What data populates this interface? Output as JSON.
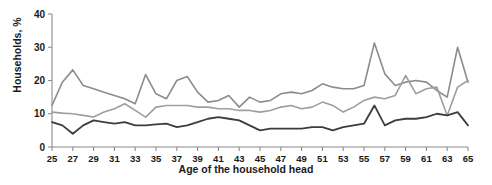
{
  "chart_data": {
    "type": "line",
    "title": "",
    "xlabel": "Age of the household head",
    "ylabel": "Households, %",
    "xlim": [
      25,
      65
    ],
    "ylim": [
      0,
      40
    ],
    "yticks": [
      0,
      10,
      20,
      30,
      40
    ],
    "xticks": [
      25,
      27,
      29,
      31,
      33,
      35,
      37,
      39,
      41,
      43,
      45,
      47,
      49,
      51,
      53,
      55,
      57,
      59,
      61,
      63,
      65
    ],
    "grid": false,
    "legend": "none",
    "x": [
      25,
      26,
      27,
      28,
      29,
      30,
      31,
      32,
      33,
      34,
      35,
      36,
      37,
      38,
      39,
      40,
      41,
      42,
      43,
      44,
      45,
      46,
      47,
      48,
      49,
      50,
      51,
      52,
      53,
      54,
      55,
      56,
      57,
      58,
      59,
      60,
      61,
      62,
      63,
      64,
      65
    ],
    "series": [
      {
        "name": "upper-line",
        "color": "#8c8c8c",
        "values": [
          12.5,
          19.5,
          23.2,
          18.5,
          17.5,
          16.5,
          15.5,
          14.5,
          13.0,
          21.8,
          16.0,
          14.5,
          20.0,
          21.2,
          16.5,
          13.5,
          14.0,
          15.5,
          12.0,
          15.0,
          13.5,
          14.0,
          16.0,
          16.5,
          16.0,
          17.0,
          19.0,
          18.0,
          17.5,
          17.5,
          18.5,
          31.3,
          22.0,
          18.5,
          19.5,
          20.0,
          19.5,
          17.0,
          15.0,
          30.0,
          19.5
        ]
      },
      {
        "name": "middle-line",
        "color": "#9e9e9e",
        "values": [
          10.5,
          10.2,
          10.0,
          9.5,
          9.0,
          10.5,
          11.5,
          13.0,
          11.0,
          9.0,
          12.0,
          12.5,
          12.5,
          12.5,
          12.0,
          12.0,
          11.5,
          11.5,
          11.0,
          11.0,
          10.5,
          11.0,
          12.0,
          12.5,
          11.5,
          12.0,
          13.5,
          12.5,
          10.5,
          12.0,
          14.0,
          15.0,
          14.5,
          15.5,
          21.5,
          16.0,
          17.5,
          18.0,
          9.5,
          18.0,
          20.0
        ]
      },
      {
        "name": "lower-line",
        "color": "#3d3d3d",
        "values": [
          7.5,
          6.5,
          4.0,
          6.5,
          8.0,
          7.5,
          7.0,
          7.5,
          6.5,
          6.5,
          6.8,
          7.0,
          6.0,
          6.5,
          7.5,
          8.5,
          9.0,
          8.5,
          8.0,
          6.5,
          5.0,
          5.5,
          5.5,
          5.5,
          5.5,
          6.0,
          6.0,
          5.0,
          6.0,
          6.5,
          7.0,
          12.5,
          6.5,
          8.0,
          8.5,
          8.5,
          9.0,
          10.0,
          9.5,
          10.5,
          6.5
        ]
      }
    ]
  }
}
